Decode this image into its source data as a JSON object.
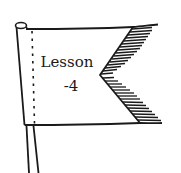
{
  "illustration": {
    "subject": "pennant flag on a pole",
    "label_line1": "Lesson",
    "label_line2": "-4"
  },
  "colors": {
    "ink": "#1a1a1a",
    "background": "#ffffff"
  }
}
